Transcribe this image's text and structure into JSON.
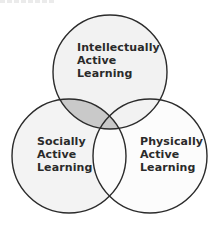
{
  "diagram": {
    "type": "venn",
    "sets": [
      {
        "id": "intellectual",
        "position": "top",
        "lines": [
          "Intellectually",
          "Active",
          "Learning"
        ],
        "cx": 110,
        "cy": 72,
        "r": 57,
        "fill": "#f2f2f2"
      },
      {
        "id": "social",
        "position": "bottom-left",
        "lines": [
          "Socially",
          "Active",
          "Learning"
        ],
        "cx": 69,
        "cy": 156,
        "r": 57,
        "fill": "#f3f3f3"
      },
      {
        "id": "physical",
        "position": "bottom-right",
        "lines": [
          "Physically",
          "Active",
          "Learning"
        ],
        "cx": 150,
        "cy": 156,
        "r": 57,
        "fill": "#fcfcfc"
      }
    ],
    "highlighted_overlap": {
      "sets": [
        "intellectual",
        "social"
      ],
      "fill": "#c9c9c9"
    },
    "colors": {
      "stroke": "#2b2b2b",
      "text": "#2a2a2a",
      "background": "#ffffff"
    }
  }
}
